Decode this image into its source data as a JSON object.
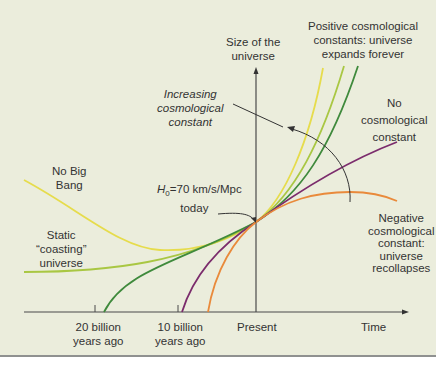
{
  "axes": {
    "y_label_line1": "Size of the",
    "y_label_line2": "universe",
    "x_label": "Time",
    "ticks": [
      {
        "line1": "20 billion",
        "line2": "years ago"
      },
      {
        "line1": "10 billion",
        "line2": "years ago"
      },
      {
        "line1": "Present",
        "line2": ""
      }
    ]
  },
  "labels": {
    "positive": [
      "Positive cosmological",
      "constants: universe",
      "expands forever"
    ],
    "no_const": [
      "No",
      "cosmological",
      "constant"
    ],
    "increasing": [
      "Increasing",
      "cosmological",
      "constant"
    ],
    "no_big_bang": [
      "No Big",
      "Bang"
    ],
    "static": [
      "Static",
      "“coasting”",
      "universe"
    ],
    "negative": [
      "Negative",
      "cosmological",
      "constant:",
      "universe",
      "recollapses"
    ],
    "h0_prefix": "H",
    "h0_sub": "0",
    "h0_rest": "=70 km/s/Mpc",
    "h0_today": "today"
  },
  "colors": {
    "background": "#ebeddc",
    "axis": "#4a4a4a",
    "no_big_bang": "#e6dc4c",
    "light_green": "#a9c743",
    "dark_green": "#3f8a3c",
    "purple": "#7b2c6c",
    "orange": "#e98a3b"
  }
}
